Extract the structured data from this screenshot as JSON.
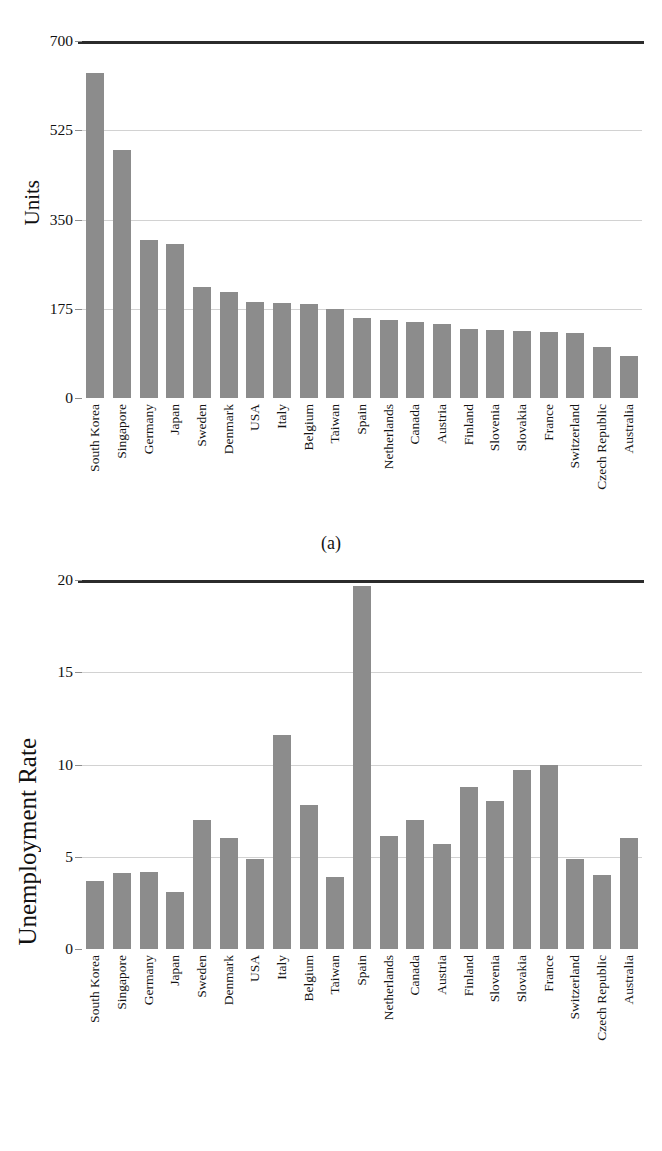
{
  "figures": [
    {
      "id": "a",
      "caption": "(a)",
      "ylabel": "Units"
    },
    {
      "id": "b",
      "caption": "(b)",
      "ylabel": "Unemployment Rate"
    }
  ],
  "colors": {
    "bar": "#8c8c8c",
    "gridline": "#d2d2d2",
    "axis": "#2b2b2b",
    "text": "#111111"
  },
  "chart_data": [
    {
      "type": "bar",
      "panel": "(a)",
      "title": "",
      "xlabel": "",
      "ylabel": "Units",
      "ylim": [
        0,
        700
      ],
      "yticks": [
        0,
        175,
        350,
        525,
        700
      ],
      "ytick_labels": [
        "0",
        "175",
        "350",
        "525",
        "700"
      ],
      "grid": true,
      "legend": "none",
      "categories": [
        "South Korea",
        "Singapore",
        "Germany",
        "Japan",
        "Sweden",
        "Denmark",
        "USA",
        "Italy",
        "Belgium",
        "Taiwan",
        "Spain",
        "Netherlands",
        "Canada",
        "Austria",
        "Finland",
        "Slovenia",
        "Slovakia",
        "France",
        "Switzerland",
        "Czech Republic",
        "Australia"
      ],
      "values": [
        638,
        487,
        310,
        302,
        218,
        207,
        188,
        186,
        185,
        175,
        157,
        153,
        149,
        146,
        136,
        133,
        132,
        130,
        127,
        101,
        82
      ]
    },
    {
      "type": "bar",
      "panel": "(b)",
      "title": "",
      "xlabel": "",
      "ylabel": "Unemployment Rate",
      "ylim": [
        0,
        20
      ],
      "yticks": [
        0,
        5,
        10,
        15,
        20
      ],
      "ytick_labels": [
        "0",
        "5",
        "10",
        "15",
        "20"
      ],
      "grid": true,
      "legend": "none",
      "categories": [
        "South Korea",
        "Singapore",
        "Germany",
        "Japan",
        "Sweden",
        "Denmark",
        "USA",
        "Italy",
        "Belgium",
        "Taiwan",
        "Spain",
        "Netherlands",
        "Canada",
        "Austria",
        "Finland",
        "Slovenia",
        "Slovakia",
        "France",
        "Switzerland",
        "Czech Republic",
        "Australia"
      ],
      "values": [
        3.7,
        4.1,
        4.2,
        3.1,
        7.0,
        6.0,
        4.9,
        11.6,
        7.8,
        3.9,
        19.7,
        6.1,
        7.0,
        5.7,
        8.8,
        8.0,
        9.7,
        10.0,
        4.9,
        4.0,
        6.0
      ]
    }
  ]
}
